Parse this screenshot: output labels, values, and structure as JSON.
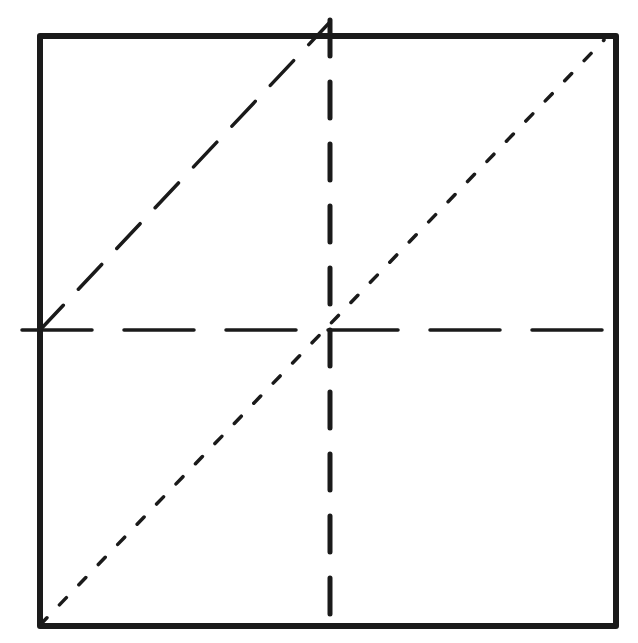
{
  "diagram": {
    "title": "",
    "style": "hand-drawn pencil sketch",
    "background": "#ffffff",
    "ink_color": "#1a1a1a",
    "square": {
      "x1": 40,
      "y1": 36,
      "x2": 616,
      "y2": 626,
      "stroke_width": 6
    },
    "lines": [
      {
        "id": "vertical-midline",
        "style": "dashed",
        "x1": 330,
        "y1": 20,
        "x2": 330,
        "y2": 626,
        "stroke_width": 5,
        "dash": "36,26"
      },
      {
        "id": "horizontal-midline",
        "style": "dashed",
        "x1": 22,
        "y1": 330,
        "x2": 616,
        "y2": 330,
        "stroke_width": 3.5,
        "dash": "70,32"
      },
      {
        "id": "upper-left-diagonal",
        "style": "long-dashed",
        "x1": 40,
        "y1": 330,
        "x2": 330,
        "y2": 22,
        "stroke_width": 3.5,
        "dash": "34,22"
      },
      {
        "id": "main-diagonal",
        "style": "dotted",
        "x1": 40,
        "y1": 625,
        "x2": 604,
        "y2": 40,
        "stroke_width": 3.5,
        "dash": "10,18"
      }
    ],
    "labels": []
  }
}
